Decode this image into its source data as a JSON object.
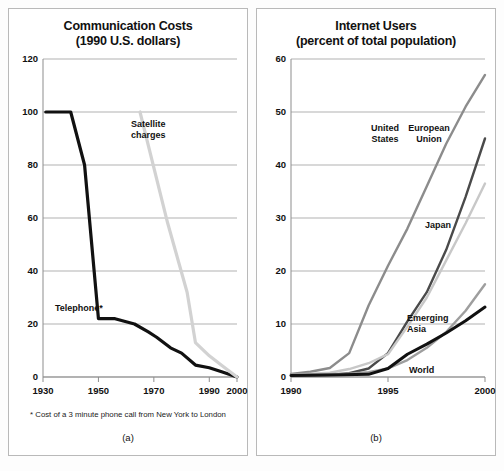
{
  "figure": {
    "background": "#ffffff",
    "border_color": "#b9b9b9"
  },
  "panel_a": {
    "title_line1": "Communication Costs",
    "title_line2": "(1990 U.S. dollars)",
    "caption": "(a)",
    "footnote": "* Cost of a 3 minute phone call from New York to London",
    "label_telephone": "Telephone*",
    "label_satellite_line1": "Satellite",
    "label_satellite_line2": "charges"
  },
  "panel_b": {
    "title_line1": "Internet Users",
    "title_line2": "(percent of total population)",
    "caption": "(b)",
    "label_us_line1": "United",
    "label_us_line2": "States",
    "label_eu_line1": "European",
    "label_eu_line2": "Union",
    "label_japan": "Japan",
    "label_emerging_line1": "Emerging",
    "label_emerging_line2": "Asia",
    "label_world": "World"
  },
  "chart_data": [
    {
      "id": "communication-costs",
      "type": "line",
      "title": "Communication Costs (1990 U.S. dollars)",
      "subtitle": "(1990 U.S. dollars)",
      "caption": "(a)",
      "xlabel": "",
      "ylabel": "",
      "xlim": [
        1930,
        2000
      ],
      "ylim": [
        0,
        120
      ],
      "xticks": [
        1930,
        1950,
        1970,
        1990,
        2000
      ],
      "xtick_labels": [
        "1930",
        "1950",
        "1970",
        "1990",
        "2000"
      ],
      "yticks": [
        0,
        20,
        40,
        60,
        80,
        100,
        120
      ],
      "ytick_labels": [
        "0",
        "20",
        "40",
        "60",
        "80",
        "100",
        "120"
      ],
      "grid": "horizontal",
      "legend": "inline-annotations",
      "note": "* Cost of a 3 minute phone call from New York to London",
      "series": [
        {
          "name": "Telephone*",
          "color": "#111111",
          "width": 3.2,
          "points": [
            [
              1931,
              100
            ],
            [
              1940,
              100
            ],
            [
              1945,
              80
            ],
            [
              1950,
              22
            ],
            [
              1956,
              22
            ],
            [
              1963,
              20
            ],
            [
              1968,
              17
            ],
            [
              1971,
              15
            ],
            [
              1976,
              11
            ],
            [
              1980,
              9
            ],
            [
              1985,
              4.5
            ],
            [
              1990,
              3.5
            ],
            [
              1995,
              1.8
            ],
            [
              2000,
              0
            ]
          ]
        },
        {
          "name": "Satellite charges",
          "color": "#d2d2d2",
          "width": 3.2,
          "points": [
            [
              1965,
              100
            ],
            [
              1975,
              58
            ],
            [
              1982,
              32
            ],
            [
              1985,
              13
            ],
            [
              1990,
              8
            ],
            [
              1995,
              4
            ],
            [
              2000,
              0
            ]
          ]
        }
      ]
    },
    {
      "id": "internet-users",
      "type": "line",
      "title": "Internet Users (percent of total population)",
      "subtitle": "(percent of total population)",
      "caption": "(b)",
      "xlabel": "",
      "ylabel": "percent of total population",
      "xlim": [
        1990,
        2000
      ],
      "ylim": [
        0,
        60
      ],
      "xticks": [
        1990,
        1995,
        2000
      ],
      "xtick_labels": [
        "1990",
        "1995",
        "2000"
      ],
      "yticks": [
        0,
        10,
        20,
        30,
        40,
        50,
        60
      ],
      "ytick_labels": [
        "0",
        "10",
        "20",
        "30",
        "40",
        "50",
        "60"
      ],
      "grid": "horizontal",
      "legend": "inline-annotations",
      "series": [
        {
          "name": "United States",
          "color": "#8c8c8c",
          "width": 2.4,
          "points": [
            [
              1990,
              0.6
            ],
            [
              1991,
              1.0
            ],
            [
              1992,
              1.7
            ],
            [
              1993,
              4.5
            ],
            [
              1994,
              13.5
            ],
            [
              1995,
              21
            ],
            [
              1996,
              28
            ],
            [
              1997,
              36
            ],
            [
              1998,
              44
            ],
            [
              1999,
              51
            ],
            [
              2000,
              57
            ]
          ]
        },
        {
          "name": "European Union",
          "color": "#4a4a4a",
          "width": 2.4,
          "points": [
            [
              1990,
              0.3
            ],
            [
              1992,
              0.4
            ],
            [
              1993,
              0.7
            ],
            [
              1994,
              1.6
            ],
            [
              1995,
              4.5
            ],
            [
              1996,
              10.5
            ],
            [
              1997,
              16
            ],
            [
              1998,
              24
            ],
            [
              1999,
              34
            ],
            [
              2000,
              45
            ]
          ]
        },
        {
          "name": "Japan",
          "color": "#c8c8c8",
          "width": 2.4,
          "points": [
            [
              1990,
              0.4
            ],
            [
              1992,
              0.8
            ],
            [
              1993,
              1.5
            ],
            [
              1994,
              2.6
            ],
            [
              1995,
              4.3
            ],
            [
              1996,
              9.5
            ],
            [
              1997,
              15
            ],
            [
              1998,
              22
            ],
            [
              1999,
              29
            ],
            [
              2000,
              36.5
            ]
          ]
        },
        {
          "name": "Emerging Asia",
          "color": "#9e9e9e",
          "width": 2.4,
          "points": [
            [
              1990,
              0.4
            ],
            [
              1993,
              0.6
            ],
            [
              1994,
              0.9
            ],
            [
              1995,
              1.6
            ],
            [
              1996,
              3.2
            ],
            [
              1997,
              5.5
            ],
            [
              1998,
              8.5
            ],
            [
              1999,
              12.5
            ],
            [
              2000,
              17.5
            ]
          ]
        },
        {
          "name": "World",
          "color": "#111111",
          "width": 3.0,
          "points": [
            [
              1990,
              0.3
            ],
            [
              1992,
              0.4
            ],
            [
              1994,
              0.5
            ],
            [
              1995,
              1.6
            ],
            [
              1996,
              4.3
            ],
            [
              1997,
              6.2
            ],
            [
              1998,
              8.3
            ],
            [
              1999,
              10.6
            ],
            [
              2000,
              13.2
            ]
          ]
        }
      ]
    }
  ]
}
